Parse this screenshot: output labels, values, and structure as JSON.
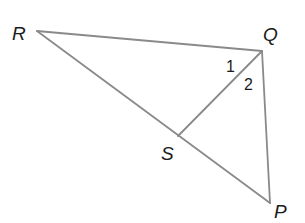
{
  "diagram": {
    "type": "geometry-triangle",
    "stroke_color": "#8a8a8a",
    "vertices": [
      {
        "id": "R",
        "label": "R",
        "x": 37,
        "y": 31,
        "label_x": 12,
        "label_y": 40
      },
      {
        "id": "Q",
        "label": "Q",
        "x": 262,
        "y": 51,
        "label_x": 263,
        "label_y": 41
      },
      {
        "id": "S",
        "label": "S",
        "x": 178,
        "y": 136,
        "label_x": 161,
        "label_y": 160
      },
      {
        "id": "P",
        "label": "P",
        "x": 270,
        "y": 203,
        "label_x": 274,
        "label_y": 218
      }
    ],
    "segments": [
      {
        "from": "R",
        "to": "Q"
      },
      {
        "from": "Q",
        "to": "P"
      },
      {
        "from": "R",
        "to": "P"
      },
      {
        "from": "Q",
        "to": "S"
      }
    ],
    "angle_labels": [
      {
        "label": "1",
        "x": 226,
        "y": 72
      },
      {
        "label": "2",
        "x": 244,
        "y": 90
      }
    ]
  }
}
